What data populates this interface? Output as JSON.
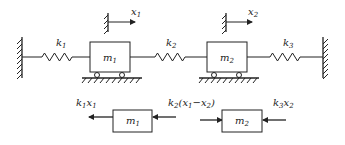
{
  "diagram": {
    "title": "",
    "system": {
      "springs": [
        {
          "id": "k1",
          "label": "k",
          "sub": "1"
        },
        {
          "id": "k2",
          "label": "k",
          "sub": "2"
        },
        {
          "id": "k3",
          "label": "k",
          "sub": "3"
        }
      ],
      "masses": [
        {
          "id": "m1",
          "label": "m",
          "sub": "1"
        },
        {
          "id": "m2",
          "label": "m",
          "sub": "2"
        }
      ],
      "displacements": [
        {
          "id": "x1",
          "label": "x",
          "sub": "1"
        },
        {
          "id": "x2",
          "label": "x",
          "sub": "2"
        }
      ]
    },
    "free_body": {
      "m1": {
        "label": "m",
        "sub": "1"
      },
      "m2": {
        "label": "m",
        "sub": "2"
      },
      "forces": {
        "f1": {
          "a": "k",
          "a_sub": "1",
          "b": "x",
          "b_sub": "1"
        },
        "f2": {
          "a": "k",
          "a_sub": "2",
          "open": "(",
          "b": "x",
          "b_sub": "1",
          "minus": "−",
          "c": "x",
          "c_sub": "2",
          "close": ")"
        },
        "f3": {
          "a": "k",
          "a_sub": "3",
          "b": "x",
          "b_sub": "2"
        }
      }
    }
  }
}
